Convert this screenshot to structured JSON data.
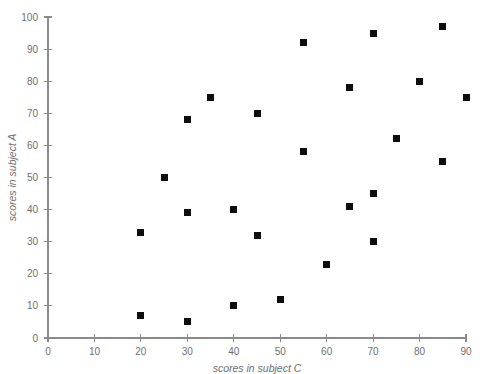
{
  "chart_data": {
    "type": "scatter",
    "title": "",
    "subtitle": "",
    "xlabel": "scores in subject C",
    "ylabel": "scores in subject A",
    "xlim": [
      0,
      90
    ],
    "ylim": [
      0,
      100
    ],
    "xticks": [
      0,
      10,
      20,
      30,
      40,
      50,
      60,
      70,
      80,
      90
    ],
    "yticks": [
      0,
      10,
      20,
      30,
      40,
      50,
      60,
      70,
      80,
      90,
      100
    ],
    "xtick_labels": [
      "0",
      "10",
      "20",
      "30",
      "40",
      "50",
      "60",
      "70",
      "80",
      "90"
    ],
    "ytick_labels": [
      "0",
      "10",
      "20",
      "30",
      "40",
      "50",
      "60",
      "70",
      "80",
      "90",
      "100"
    ],
    "grid": false,
    "legend": null,
    "marker": {
      "shape": "square",
      "color": "#0d0d0d",
      "size": 7
    },
    "axis_color": "#8a8a8a",
    "text_color": "#6e6e6e",
    "background": "#ffffff",
    "series": [
      {
        "name": "students",
        "points": [
          {
            "x": 20,
            "y": 7
          },
          {
            "x": 20,
            "y": 33
          },
          {
            "x": 25,
            "y": 50
          },
          {
            "x": 30,
            "y": 5
          },
          {
            "x": 30,
            "y": 39
          },
          {
            "x": 30,
            "y": 68
          },
          {
            "x": 35,
            "y": 75
          },
          {
            "x": 40,
            "y": 10
          },
          {
            "x": 40,
            "y": 40
          },
          {
            "x": 45,
            "y": 32
          },
          {
            "x": 45,
            "y": 70
          },
          {
            "x": 50,
            "y": 12
          },
          {
            "x": 55,
            "y": 58
          },
          {
            "x": 55,
            "y": 92
          },
          {
            "x": 60,
            "y": 23
          },
          {
            "x": 65,
            "y": 41
          },
          {
            "x": 65,
            "y": 78
          },
          {
            "x": 70,
            "y": 30
          },
          {
            "x": 70,
            "y": 45
          },
          {
            "x": 70,
            "y": 95
          },
          {
            "x": 75,
            "y": 62
          },
          {
            "x": 80,
            "y": 80
          },
          {
            "x": 85,
            "y": 55
          },
          {
            "x": 85,
            "y": 97
          },
          {
            "x": 90,
            "y": 75
          }
        ]
      }
    ]
  },
  "layout": {
    "plot_left": 48,
    "plot_right": 466,
    "plot_top": 17,
    "plot_bottom": 338
  }
}
